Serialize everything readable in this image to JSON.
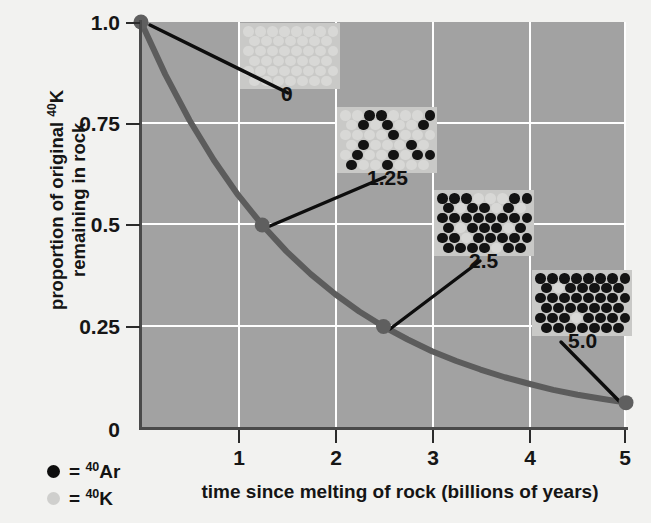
{
  "chart_data": {
    "type": "line",
    "title": "",
    "xlabel": "time since melting of rock (billions of years)",
    "ylabel_line1": "proportion of original",
    "ylabel_line1_sup": "40",
    "ylabel_line1_el": "K",
    "ylabel_line2": "remaining in rock",
    "xlim": [
      0,
      5
    ],
    "ylim": [
      0,
      1.0
    ],
    "grid": true,
    "legend_position": "bottom-left",
    "x_ticks": [
      "0",
      "1",
      "2",
      "3",
      "4",
      "5"
    ],
    "x_tick_values": [
      0,
      1,
      2,
      3,
      4,
      5
    ],
    "y_ticks": [
      "0",
      "0.25",
      "0.5",
      "0.75",
      "1.0"
    ],
    "y_tick_values": [
      0,
      0.25,
      0.5,
      0.75,
      1.0
    ],
    "series": [
      {
        "name": "proportion of 40K remaining",
        "half_life_gy": 1.25,
        "x": [
          0,
          0.25,
          0.5,
          0.75,
          1.0,
          1.25,
          1.5,
          1.75,
          2.0,
          2.25,
          2.5,
          2.75,
          3.0,
          3.25,
          3.5,
          3.75,
          4.0,
          4.25,
          4.5,
          4.75,
          5.0
        ],
        "y": [
          1.0,
          0.871,
          0.758,
          0.66,
          0.574,
          0.5,
          0.435,
          0.379,
          0.33,
          0.287,
          0.25,
          0.218,
          0.189,
          0.165,
          0.144,
          0.125,
          0.109,
          0.094,
          0.082,
          0.072,
          0.0625
        ]
      }
    ],
    "markers": [
      {
        "x": 0,
        "y": 1.0,
        "label": "0"
      },
      {
        "x": 1.25,
        "y": 0.5,
        "label": "1.25"
      },
      {
        "x": 2.5,
        "y": 0.25,
        "label": "2.5"
      },
      {
        "x": 5.0,
        "y": 0.0625,
        "label": "5.0"
      }
    ],
    "annotations": [
      {
        "label": "0",
        "describes": "all atoms are 40K at time of melting"
      },
      {
        "label": "1.25",
        "describes": "one half-life: half 40K, half 40Ar"
      },
      {
        "label": "2.5",
        "describes": "two half-lives: one quarter 40K"
      },
      {
        "label": "5.0",
        "describes": "four half-lives: one sixteenth 40K"
      }
    ],
    "colors": {
      "plot_background": "#a2a2a2",
      "inset_background": "#c9c9c7",
      "gridline": "#ffffff",
      "curve": "#5c5c5c",
      "axis": "#4a4a4a",
      "ar_atom": "#131313",
      "k_atom": "#d8d8d6",
      "page_background": "#f2f2f0"
    }
  },
  "axes": {
    "y_ticks": [
      {
        "label": "1.0",
        "value": 1.0
      },
      {
        "label": "0.75",
        "value": 0.75
      },
      {
        "label": "0.5",
        "value": 0.5
      },
      {
        "label": "0.25",
        "value": 0.25
      },
      {
        "label": "0",
        "value": 0
      }
    ],
    "x_ticks": [
      {
        "label": "0",
        "value": 0
      },
      {
        "label": "1",
        "value": 1
      },
      {
        "label": "2",
        "value": 2
      },
      {
        "label": "3",
        "value": 3
      },
      {
        "label": "4",
        "value": 4
      },
      {
        "label": "5",
        "value": 5
      }
    ],
    "x_title": "time since melting of rock (billions of years)",
    "y_title_part1": "proportion of original ",
    "y_title_sup": "40",
    "y_title_part2": "K",
    "y_title_line2": "remaining in rock"
  },
  "legend": {
    "items": [
      {
        "symbol": "filled-circle",
        "equals": "=",
        "sup": "40",
        "element": "Ar",
        "color": "#0e0e0e"
      },
      {
        "symbol": "light-circle",
        "equals": "=",
        "sup": "40",
        "element": "K",
        "color": "#cfcfcd"
      }
    ]
  },
  "insets": [
    {
      "id": "inset-0",
      "time_label": "0",
      "total_atoms": 48,
      "ar_count": 0,
      "k_count": 48,
      "rows": 6,
      "cols": 8,
      "pattern": [
        "KKKKKKKK",
        "KKKKKKKK",
        "KKKKKKKK",
        "KKKKKKKK",
        "KKKKKKKK",
        "KKKKKKKK"
      ]
    },
    {
      "id": "inset-1",
      "time_label": "1.25",
      "total_atoms": 48,
      "ar_count": 24,
      "k_count": 24,
      "rows": 6,
      "cols": 8,
      "pattern": [
        "KKAAKKKA",
        "KAKAKKAA",
        "KKKKAKKK",
        "KAKKKAKK",
        "KAKKAKAA",
        "AKKAKKKA"
      ]
    },
    {
      "id": "inset-2",
      "time_label": "2.5",
      "total_atoms": 48,
      "ar_count": 36,
      "k_count": 12,
      "rows": 6,
      "cols": 8,
      "pattern": [
        "AAAKKKAA",
        "AKAAKAKA",
        "AAAAAAAA",
        "AKAAAKAA",
        "AAKAAAAA",
        "AAAAKAAA"
      ]
    },
    {
      "id": "inset-3",
      "time_label": "5.0",
      "total_atoms": 48,
      "ar_count": 46,
      "k_count": 2,
      "rows": 6,
      "cols": 8,
      "pattern": [
        "AAAAAAAA",
        "AKAAAAAA",
        "AAAAAAAA",
        "AAAAAAAA",
        "AAAKAAAA",
        "AAAAAAAA"
      ]
    }
  ]
}
